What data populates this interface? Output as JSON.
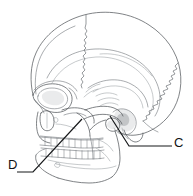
{
  "figure": {
    "view": "lateral",
    "background_color": "#ffffff",
    "line_color": "#555a5e",
    "label_color": "#111315"
  },
  "labels": [
    {
      "id": "C",
      "text": "C",
      "position": "right",
      "points_to": "mandibular-condyle-temporomandibular-joint"
    },
    {
      "id": "D",
      "text": "D",
      "position": "bottom-left",
      "points_to": "coronoid-process-zygomatic-region"
    }
  ],
  "regions": [
    {
      "name": "frontal-bone"
    },
    {
      "name": "parietal-bone"
    },
    {
      "name": "occipital-bone"
    },
    {
      "name": "temporal-bone"
    },
    {
      "name": "coronal-suture"
    },
    {
      "name": "lambdoid-suture"
    },
    {
      "name": "squamous-suture"
    },
    {
      "name": "orbit"
    },
    {
      "name": "nasal-aperture"
    },
    {
      "name": "zygomatic-arch"
    },
    {
      "name": "maxilla"
    },
    {
      "name": "mandible"
    },
    {
      "name": "upper-teeth"
    },
    {
      "name": "lower-teeth"
    },
    {
      "name": "mental-foramen"
    },
    {
      "name": "external-acoustic-meatus"
    }
  ]
}
